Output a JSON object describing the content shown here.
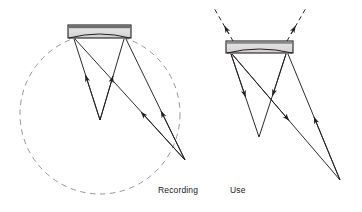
{
  "figure": {
    "background_color": "#ffffff",
    "ink_color": "#231f20",
    "plate_fill_top": "#6e6e6e",
    "plate_fill_body": "#d9d9d9",
    "dashed_color": "#8a8a8a"
  },
  "captions": {
    "recording": "Recording",
    "use": "Use"
  },
  "panels": [
    {
      "id": "recording",
      "label": "Recording",
      "label_position": {
        "x": 158,
        "y": 185
      },
      "reference_circle": {
        "shape": "circle",
        "style": "dashed",
        "center": {
          "x": 100,
          "y": 114
        },
        "radius": 80
      },
      "plate": {
        "shape": "rectangle-with-concave-arc",
        "x": 68,
        "y": 25,
        "width": 63,
        "height": 13,
        "top_band_height": 3,
        "arc_sag": 6
      },
      "object_point": {
        "x": 100,
        "y": 120
      },
      "source_point": {
        "x": 185,
        "y": 160
      },
      "rays": [
        {
          "from": {
            "x": 74,
            "y": 39
          },
          "to": {
            "x": 100,
            "y": 120
          },
          "arrow": "midpoint-toward-plate"
        },
        {
          "from": {
            "x": 124,
            "y": 39
          },
          "to": {
            "x": 100,
            "y": 120
          },
          "arrow": "midpoint-toward-plate"
        },
        {
          "from": {
            "x": 75,
            "y": 39
          },
          "to": {
            "x": 185,
            "y": 160
          },
          "arrow": "midpoint-toward-plate"
        },
        {
          "from": {
            "x": 126,
            "y": 39
          },
          "to": {
            "x": 185,
            "y": 160
          },
          "arrow": "midpoint-toward-plate"
        }
      ]
    },
    {
      "id": "use",
      "label": "Use",
      "label_position": {
        "x": 230,
        "y": 185
      },
      "reference_circle": null,
      "plate": {
        "shape": "rectangle-with-concave-arc",
        "x": 226,
        "y": 41,
        "width": 67,
        "height": 12,
        "top_band_height": 2,
        "arc_sag": 6
      },
      "image_point": {
        "x": 259,
        "y": 137
      },
      "source_point": {
        "x": 340,
        "y": 180
      },
      "rays": [
        {
          "from": {
            "x": 231,
            "y": 54
          },
          "to": {
            "x": 259,
            "y": 137
          },
          "arrow": "midpoint-away-from-plate"
        },
        {
          "from": {
            "x": 286,
            "y": 54
          },
          "to": {
            "x": 259,
            "y": 137
          },
          "arrow": "midpoint-away-from-plate"
        },
        {
          "from": {
            "x": 232,
            "y": 54
          },
          "to": {
            "x": 340,
            "y": 180
          },
          "arrow": "midpoint-away-from-plate"
        },
        {
          "from": {
            "x": 288,
            "y": 54
          },
          "to": {
            "x": 340,
            "y": 180
          },
          "arrow": "midpoint-toward-plate"
        }
      ],
      "dashed_output_rays": [
        {
          "from": {
            "x": 231,
            "y": 41
          },
          "to": {
            "x": 215,
            "y": 9
          },
          "arrow": "end"
        },
        {
          "from": {
            "x": 288,
            "y": 41
          },
          "to": {
            "x": 304,
            "y": 9
          },
          "arrow": "end"
        }
      ]
    }
  ]
}
